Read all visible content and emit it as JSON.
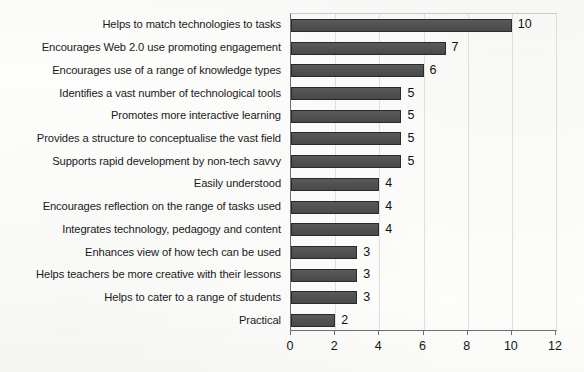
{
  "chart_data": {
    "type": "bar",
    "orientation": "horizontal",
    "title": "",
    "xlabel": "",
    "ylabel": "",
    "xlim": [
      0,
      12
    ],
    "xticks": [
      0,
      2,
      4,
      6,
      8,
      10,
      12
    ],
    "grid": true,
    "legend": null,
    "show_value_labels": true,
    "bar_color": "#4d4d4d",
    "bar_edge_color": "#2a2a2a",
    "background_color": "#fdfdfc",
    "categories": [
      "Helps to match technologies to tasks",
      "Encourages Web 2.0 use promoting engagement",
      "Encourages use of a range of knowledge types",
      "Identifies a vast number of technological tools",
      "Promotes more interactive learning",
      "Provides a structure to conceptualise the vast field",
      "Supports rapid development by non-tech savvy",
      "Easily understood",
      "Encourages reflection on the range of tasks used",
      "Integrates technology, pedagogy and content",
      "Enhances view of how tech can be used",
      "Helps teachers be more creative with their lessons",
      "Helps to cater to a range of students",
      "Practical"
    ],
    "values": [
      10,
      7,
      6,
      5,
      5,
      5,
      5,
      4,
      4,
      4,
      3,
      3,
      3,
      2
    ],
    "value_labels": [
      "10",
      "7",
      "6",
      "5",
      "5",
      "5",
      "5",
      "4",
      "4",
      "4",
      "3",
      "3",
      "3",
      "2"
    ],
    "xtick_labels": [
      "0",
      "2",
      "4",
      "6",
      "8",
      "10",
      "12"
    ]
  }
}
